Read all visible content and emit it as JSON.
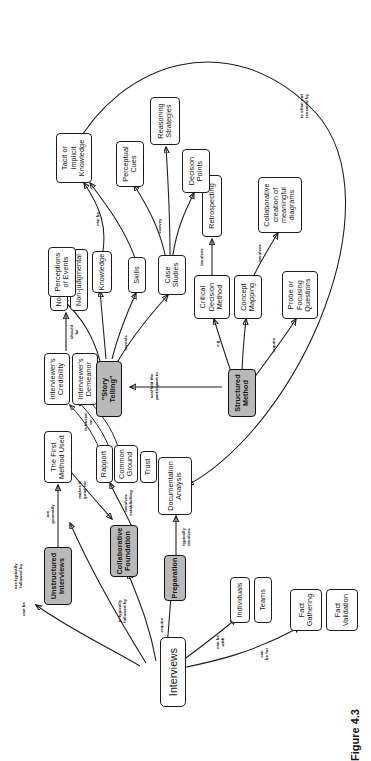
{
  "figure": {
    "caption": "Figure 4.3",
    "orientation": "rotated-90-ccw",
    "node_fill_shaded": "#b9b9b9",
    "node_fill_plain": "#ffffff",
    "stroke": "#1b1b1b"
  },
  "nodes": {
    "interviews": "Interviews",
    "fact_gathering": "Fact\nGathering",
    "fact_validation": "Fact\nValidation",
    "individuals": "Individuals",
    "teams": "Teams",
    "preparation": "Preparation",
    "documentation_analysis": "Documentation\nAnalysis",
    "collaborative_foundation": "Collaborative\nFoundation",
    "rapport": "Rapport",
    "common_ground": "Common\nGround",
    "trust": "Trust",
    "unstructured_interviews": "Unstructured\nInterviews",
    "first_method_used": "The First\nMethod Used",
    "interviewers_credibility": "Interviewer's\nCredibility",
    "interviewers_demeanor": "Interviewer's\nDemeanor",
    "non_threatening": "Non-threatening",
    "non_judgmental": "Non-judgmental",
    "structured_method": "Structured\nMethod",
    "probe_focusing_questions": "Probe or\nFocusing\nQuestions",
    "concept_mapping": "Concept\nMapping",
    "critical_decision_method": "Critical\nDecision\nMethod",
    "collaborative_creation": "Collaborative\ncreation of\nmeaningful\ndiagrams",
    "retrospecting": "Retrospecting",
    "story_telling": "\"Story Telling\"",
    "case_studies": "Case\nStudies",
    "skills": "Skills",
    "knowledge": "Knowledge",
    "perceptions_of_events": "Perceptions\nof Events",
    "decision_points": "Decision\nPoints",
    "perceptual_cues": "Perceptual\nCues",
    "reasoning_strategies": "Reasoning\nStrategies",
    "tacit_knowledge": "Tacit or\nImplicit\nKnowledge"
  },
  "edge_labels": {
    "can_be_for": "can\nbe for",
    "can_be_with": "can be\nwith",
    "require": "require",
    "is_typically_followed_by": "is typically\nfollowed by",
    "can_be": "can be",
    "typically_involves": "typically\ninvolves",
    "involves_establishing": "involves\nestablishing",
    "makes_it_good_for": "makes it\ngood for",
    "are_generally": "are\ngenerally",
    "is_based_on": "is based\non",
    "should_be": "should\nbe",
    "are_typically_followed_by": "are typically\nfollowed by",
    "requires": "require",
    "eg": "e.g.",
    "involves_cdm": "involves",
    "involves_cm": "involves",
    "scaffold": "scaffold the\nparticipant in",
    "reveals": "reveals",
    "convey": "convey",
    "can_be_tacit": "can be",
    "is_often_not_revealed_by": "is often not\nrevealed by"
  }
}
